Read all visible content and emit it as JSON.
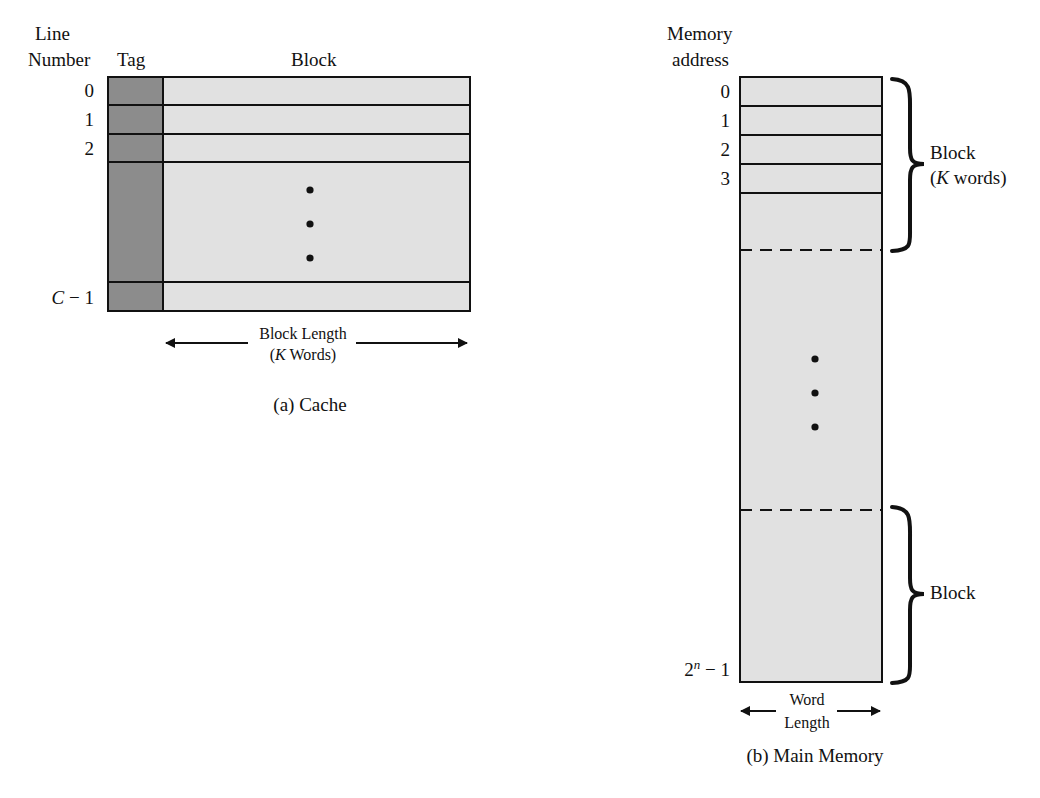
{
  "cache": {
    "header_line": "Line",
    "header_number": "Number",
    "header_tag": "Tag",
    "header_block": "Block",
    "line_labels": [
      "0",
      "1",
      "2"
    ],
    "last_line_label_var": "C",
    "last_line_label_rest": " − 1",
    "block_length_line1": "Block Length",
    "block_length_open": "(",
    "block_length_var": "K",
    "block_length_rest": " Words)",
    "caption": "(a) Cache",
    "colors": {
      "tag_fill": "#8c8c8c",
      "block_fill": "#e1e1e1",
      "stroke": "#111111"
    }
  },
  "memory": {
    "header_line1": "Memory",
    "header_line2": "address",
    "address_labels": [
      "0",
      "1",
      "2",
      "3"
    ],
    "last_address_base": "2",
    "last_address_exp": "n",
    "last_address_rest": " − 1",
    "top_block_label": "Block",
    "top_block_open": "(",
    "top_block_var": "K",
    "top_block_rest": " words)",
    "bottom_block_label": "Block",
    "word_length_line1": "Word",
    "word_length_line2": "Length",
    "caption": "(b) Main Memory",
    "colors": {
      "fill": "#e1e1e1",
      "stroke": "#111111"
    }
  }
}
